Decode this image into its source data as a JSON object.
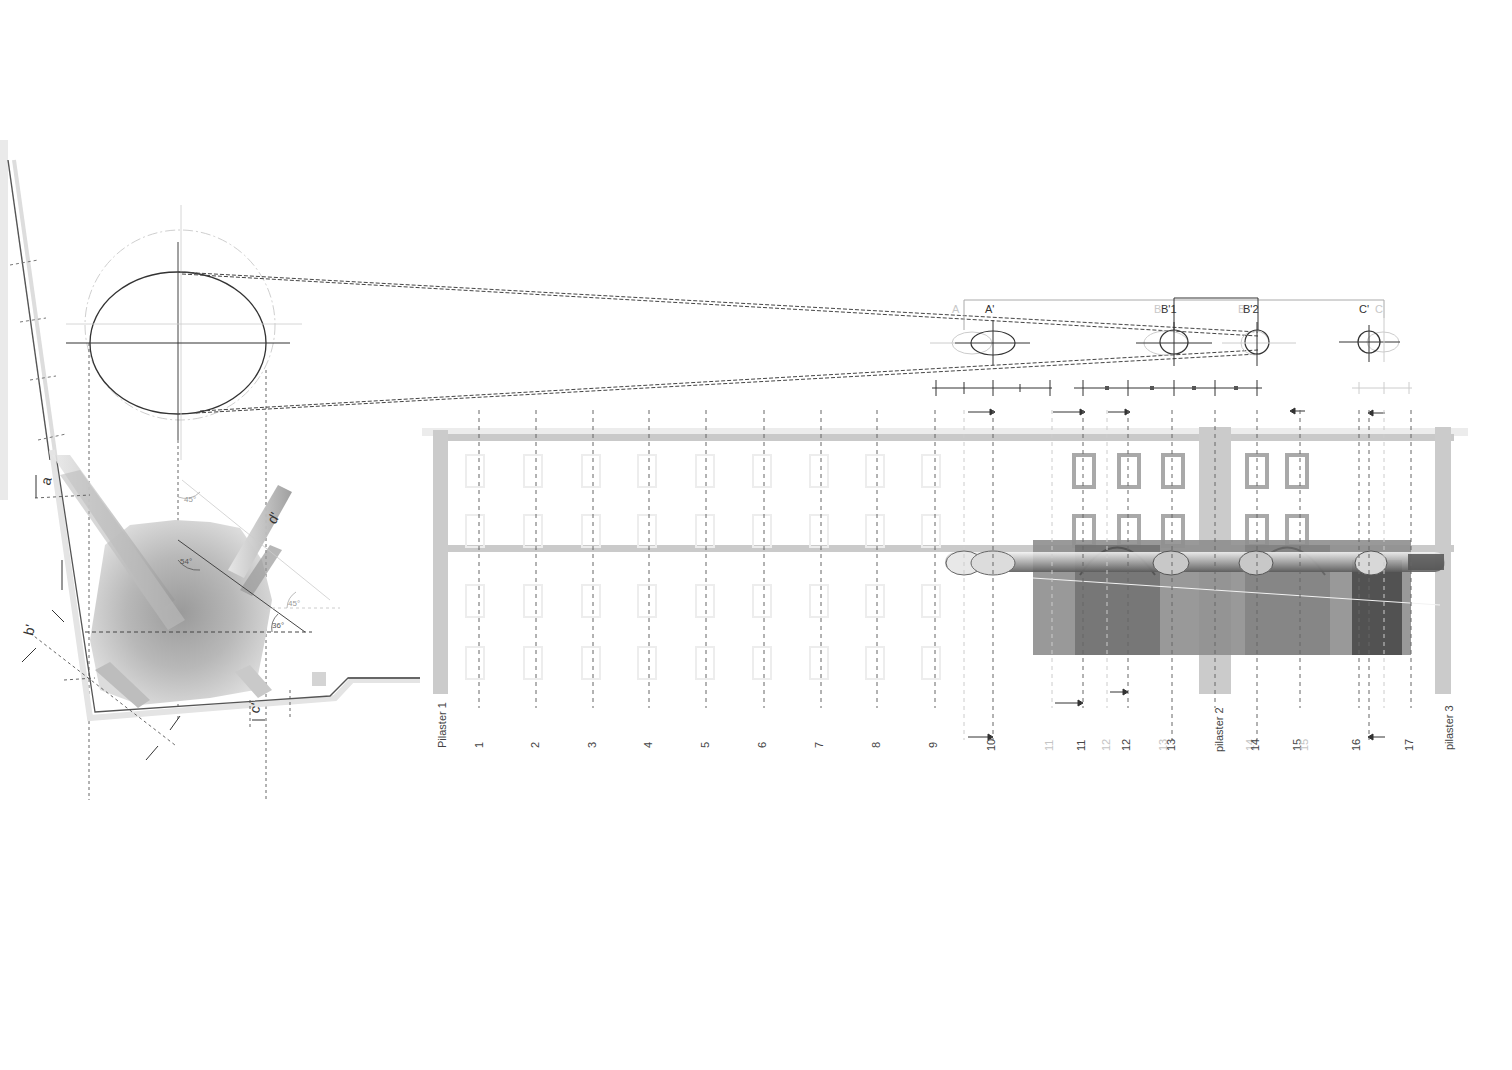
{
  "drawing": {
    "type": "architectural projection / anamorphic construction",
    "plan_view": {
      "angles": [
        "54°",
        "45°",
        "45°",
        "36°"
      ],
      "section_letters": [
        "a",
        "b'",
        "c'",
        "d'"
      ],
      "faint_letters": [
        "a",
        "b",
        "c",
        "c"
      ]
    },
    "projection_marks": {
      "primary": [
        "A'",
        "B'1",
        "B'2",
        "C'"
      ],
      "faint": [
        "A",
        "B",
        "B",
        "C"
      ]
    },
    "elevation": {
      "pilasters": [
        "Pilaster 1",
        "pilaster 2",
        "pilaster 3"
      ],
      "bay_labels": [
        "1",
        "2",
        "3",
        "4",
        "5",
        "6",
        "7",
        "8",
        "9",
        "10",
        "11",
        "12",
        "13",
        "14",
        "15",
        "16",
        "17"
      ],
      "faint_bay_labels": [
        "11",
        "12",
        "13",
        "14",
        "15"
      ]
    },
    "colors": {
      "ink": "#333333",
      "dash": "#555555",
      "pilaster": "#c8c8c8",
      "overlay_dark": "#7a7a7a",
      "faint": "#cfcfcf"
    }
  }
}
